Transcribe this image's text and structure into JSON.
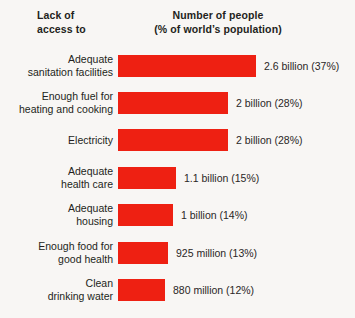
{
  "header": {
    "left_title_lines": [
      "Lack of",
      "access to"
    ],
    "right_title_lines": [
      "Number of people",
      "(% of world’s population)"
    ]
  },
  "colors": {
    "bar": "#ee2012",
    "background": "#f8f6f4",
    "text": "#231f20"
  },
  "chart_data": {
    "type": "bar",
    "orientation": "horizontal",
    "title": "Number of people (% of world’s population)",
    "xlabel": "",
    "ylabel": "Lack of access to",
    "grid": false,
    "legend": false,
    "xlim": [
      0,
      2.8
    ],
    "unit": "billions of people",
    "categories": [
      "Adequate sanitation facilities",
      "Enough fuel for heating and cooking",
      "Electricity",
      "Adequate health care",
      "Adequate housing",
      "Enough food for good health",
      "Clean drinking water"
    ],
    "values": [
      2.6,
      2.0,
      2.0,
      1.1,
      1.0,
      0.925,
      0.88
    ],
    "percentages": [
      37,
      28,
      28,
      15,
      14,
      13,
      12
    ],
    "rows": [
      {
        "label_lines": [
          "Adequate",
          "sanitation facilities"
        ],
        "value": 2.6,
        "percent": 37,
        "value_label": "2.6 billion (37%)",
        "bar_width_px": 138
      },
      {
        "label_lines": [
          "Enough fuel for",
          "heating and cooking"
        ],
        "value": 2.0,
        "percent": 28,
        "value_label": "2 billion (28%)",
        "bar_width_px": 110
      },
      {
        "label_lines": [
          "Electricity"
        ],
        "value": 2.0,
        "percent": 28,
        "value_label": "2 billion (28%)",
        "bar_width_px": 110
      },
      {
        "label_lines": [
          "Adequate",
          "health care"
        ],
        "value": 1.1,
        "percent": 15,
        "value_label": "1.1 billion (15%)",
        "bar_width_px": 58
      },
      {
        "label_lines": [
          "Adequate",
          "housing"
        ],
        "value": 1.0,
        "percent": 14,
        "value_label": "1 billion (14%)",
        "bar_width_px": 55
      },
      {
        "label_lines": [
          "Enough food for",
          "good health"
        ],
        "value": 0.925,
        "percent": 13,
        "value_label": "925 million (13%)",
        "bar_width_px": 50
      },
      {
        "label_lines": [
          "Clean",
          "drinking water"
        ],
        "value": 0.88,
        "percent": 12,
        "value_label": "880 million (12%)",
        "bar_width_px": 47
      }
    ]
  }
}
